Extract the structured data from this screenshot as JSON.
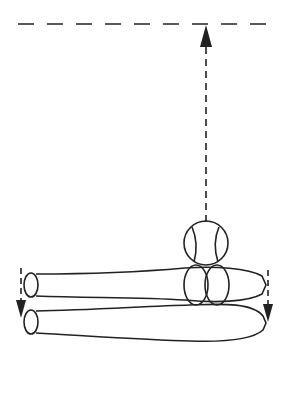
{
  "diagram": {
    "colors": {
      "stroke": "#222222",
      "background": "#ffffff"
    },
    "elements": {
      "height_line": {
        "type": "dashed-line",
        "y": 24
      },
      "launch_arrow": {
        "type": "dashed-arrow",
        "direction": "up"
      },
      "upper_ball": {
        "type": "baseball"
      },
      "lower_balls": {
        "type": "baseball",
        "count": 2
      },
      "bats": {
        "type": "bat",
        "count": 2
      },
      "left_drop_arrow": {
        "type": "dashed-arrow",
        "direction": "down"
      },
      "right_drop_arrow": {
        "type": "dashed-arrow",
        "direction": "down"
      }
    }
  }
}
